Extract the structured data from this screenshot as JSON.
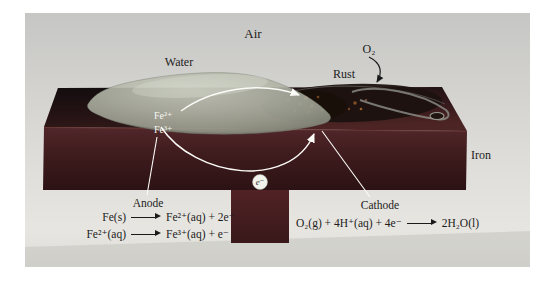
{
  "figure": {
    "labels": {
      "air": "Air",
      "o2": "O₂",
      "water": "Water",
      "rust": "Rust",
      "iron": "Iron",
      "anode": "Anode",
      "cathode": "Cathode",
      "fe2": "Fe²⁺",
      "fe3": "Fe³⁺",
      "electron": "e⁻"
    },
    "reactions": {
      "anode": [
        {
          "lhs": "Fe(s)",
          "rhs": "Fe²⁺(aq) + 2e⁻"
        },
        {
          "lhs": "Fe²⁺(aq)",
          "rhs": "Fe³⁺(aq) + e⁻"
        }
      ],
      "cathode": [
        {
          "lhs": "O₂(g) + 4H⁺(aq) + 4e⁻",
          "rhs": "2H₂O(l)"
        }
      ]
    },
    "colors": {
      "background_top": "#c6c6c4",
      "background_bottom": "#eceae5",
      "iron_front": "#45201f",
      "iron_top": "#3a1b1a",
      "iron_dark": "#1b1113",
      "pedestal": "#461e20",
      "water_gray": "#aeb1a3",
      "rust_dark": "#1c1210",
      "rust_orange": "#8a5428",
      "annotation_white": "#fbfbf8",
      "text_black": "#1a1a1a"
    }
  }
}
